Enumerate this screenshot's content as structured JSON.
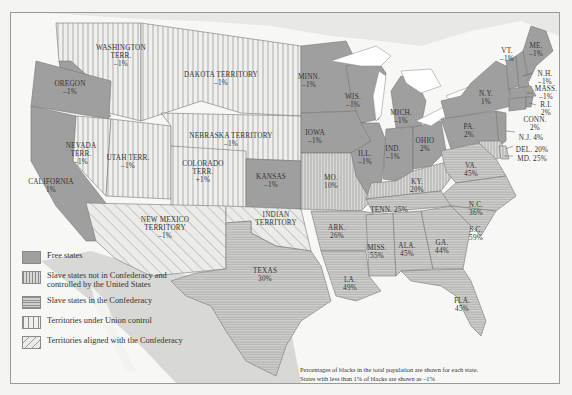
{
  "map": {
    "colors": {
      "free_states": "#9f9f9f",
      "slave_union": "#c8c8c8",
      "slave_confederacy": "#c2c2c2",
      "territory_union": "#ececea",
      "territory_confederacy": "#e2e2e0",
      "water": "#ffffff",
      "outside": "#d6d6d4"
    },
    "regions": [
      {
        "name": "WASHINGTON TERR.",
        "value": "–1%",
        "category": "territory_union"
      },
      {
        "name": "OREGON",
        "value": "–1%",
        "category": "free_states"
      },
      {
        "name": "CALIFORNIA",
        "value": "1%",
        "category": "free_states"
      },
      {
        "name": "NEVADA TERR.",
        "value": "–1%",
        "category": "territory_union"
      },
      {
        "name": "UTAH TERR.",
        "value": "–1%",
        "category": "territory_union"
      },
      {
        "name": "DAKOTA TERRITORY",
        "value": "–1%",
        "category": "territory_union"
      },
      {
        "name": "NEBRASKA TERRITORY",
        "value": "–1%",
        "category": "territory_union"
      },
      {
        "name": "COLORADO TERR.",
        "value": "–1%",
        "category": "territory_union"
      },
      {
        "name": "KANSAS",
        "value": "–1%",
        "category": "free_states"
      },
      {
        "name": "NEW MEXICO TERRITORY",
        "value": "–1%",
        "category": "territory_confederacy"
      },
      {
        "name": "INDIAN TERRITORY",
        "value": "",
        "category": "territory_confederacy"
      },
      {
        "name": "TEXAS",
        "value": "30%",
        "category": "slave_confederacy"
      },
      {
        "name": "MINN.",
        "value": "–1%",
        "category": "free_states"
      },
      {
        "name": "IOWA",
        "value": "–1%",
        "category": "free_states"
      },
      {
        "name": "WIS.",
        "value": "–1%",
        "category": "free_states"
      },
      {
        "name": "ILL.",
        "value": "–1%",
        "category": "free_states"
      },
      {
        "name": "MICH.",
        "value": "–1%",
        "category": "free_states"
      },
      {
        "name": "IND.",
        "value": "–1%",
        "category": "free_states"
      },
      {
        "name": "OHIO",
        "value": "2%",
        "category": "free_states"
      },
      {
        "name": "MO.",
        "value": "10%",
        "category": "slave_union"
      },
      {
        "name": "KY.",
        "value": "20%",
        "category": "slave_union"
      },
      {
        "name": "ARK.",
        "value": "26%",
        "category": "slave_confederacy"
      },
      {
        "name": "TENN.",
        "value": "25%",
        "category": "slave_confederacy"
      },
      {
        "name": "LA.",
        "value": "49%",
        "category": "slave_confederacy"
      },
      {
        "name": "MISS.",
        "value": "55%",
        "category": "slave_confederacy"
      },
      {
        "name": "ALA.",
        "value": "45%",
        "category": "slave_confederacy"
      },
      {
        "name": "GA.",
        "value": "44%",
        "category": "slave_confederacy"
      },
      {
        "name": "FLA.",
        "value": "45%",
        "category": "slave_confederacy"
      },
      {
        "name": "S.C.",
        "value": "59%",
        "category": "slave_confederacy"
      },
      {
        "name": "N.C.",
        "value": "36%",
        "category": "slave_confederacy"
      },
      {
        "name": "VA.",
        "value": "45%",
        "category": "slave_confederacy"
      },
      {
        "name": "PA.",
        "value": "2%",
        "category": "free_states"
      },
      {
        "name": "N.Y.",
        "value": "1%",
        "category": "free_states"
      },
      {
        "name": "VT.",
        "value": "–1%",
        "category": "free_states"
      },
      {
        "name": "ME.",
        "value": "–1%",
        "category": "free_states"
      },
      {
        "name": "N.H.",
        "value": "–1%",
        "category": "free_states"
      },
      {
        "name": "MASS.",
        "value": "–1%",
        "category": "free_states"
      },
      {
        "name": "R.I.",
        "value": "2%",
        "category": "free_states"
      },
      {
        "name": "CONN.",
        "value": "2%",
        "category": "free_states"
      },
      {
        "name": "N.J.",
        "value": "4%",
        "category": "free_states"
      },
      {
        "name": "DEL.",
        "value": "20%",
        "category": "slave_union"
      },
      {
        "name": "MD.",
        "value": "25%",
        "category": "slave_union"
      }
    ],
    "labels": {
      "wa": "WASHINGTON",
      "wa2": "TERR.",
      "wa_v": "–1%",
      "or": "OREGON",
      "or_v": "–1%",
      "ca": "CALIFORNIA",
      "ca_v": "1%",
      "nv": "NEVADA",
      "nv2": "TERR.",
      "nv_v": "–1%",
      "ut": "UTAH TERR.",
      "ut_v": "–1%",
      "dk": "DAKOTA TERRITORY",
      "dk_v": "–1%",
      "ne": "NEBRASKA TERRITORY",
      "ne_v": "–1%",
      "co": "COLORADO",
      "co2": "TERR.",
      "co_v": "+1%",
      "ks": "KANSAS",
      "ks_v": "–1%",
      "nm": "NEW MEXICO",
      "nm2": "TERRITORY",
      "nm_v": "–1%",
      "it": "INDIAN",
      "it2": "TERRITORY",
      "tx": "TEXAS",
      "tx_v": "30%",
      "mn": "MINN.",
      "mn_v": "–1%",
      "ia": "IOWA",
      "ia_v": "–1%",
      "wi": "WIS.",
      "wi_v": "–1%",
      "il": "ILL.",
      "il_v": "–1%",
      "mi": "MICH.",
      "mi_v": "–1%",
      "in": "IND.",
      "in_v": "–1%",
      "oh": "OHIO",
      "oh_v": "2%",
      "mo": "MO.",
      "mo_v": "10%",
      "ky": "KY.",
      "ky_v": "20%",
      "ar": "ARK.",
      "ar_v": "26%",
      "tn": "TENN. 25%",
      "la": "LA.",
      "la_v": "49%",
      "ms": "MISS.",
      "ms_v": "55%",
      "al": "ALA.",
      "al_v": "45%",
      "ga": "GA.",
      "ga_v": "44%",
      "fl": "FLA.",
      "fl_v": "45%",
      "sc": "S.C.",
      "sc_v": "59%",
      "nc": "N.C.",
      "nc_v": "36%",
      "va": "VA.",
      "va_v": "45%",
      "pa": "PA.",
      "pa_v": "2%",
      "ny": "N.Y.",
      "ny_v": "1%",
      "vt": "VT.",
      "vt_v": "–1%",
      "me": "ME.",
      "me_v": "–1%",
      "nh": "N.H.",
      "nh_v": "–1%",
      "ma": "MASS.",
      "ma_v": "–1%",
      "ri": "R.I.",
      "ri_v": "2%",
      "ct": "CONN.",
      "ct_v": "2%",
      "nj": "N.J. 4%",
      "de": "DEL. 20%",
      "md": "MD. 25%"
    }
  },
  "legend": {
    "items": [
      {
        "label": "Free states",
        "pattern": "solid-dark"
      },
      {
        "label": "Slave states not in Confederacy and controlled by the United States",
        "pattern": "vertical-dense"
      },
      {
        "label": "Slave states in the Confederacy",
        "pattern": "horizontal"
      },
      {
        "label": "Territories under Union control",
        "pattern": "vertical-sparse"
      },
      {
        "label": "Territories aligned with the Confederacy",
        "pattern": "diagonal"
      }
    ]
  },
  "note": {
    "line1": "Percentages of blacks in the total population are shown for each state.",
    "line2": "States with less than 1% of blacks are shown as –1%"
  }
}
